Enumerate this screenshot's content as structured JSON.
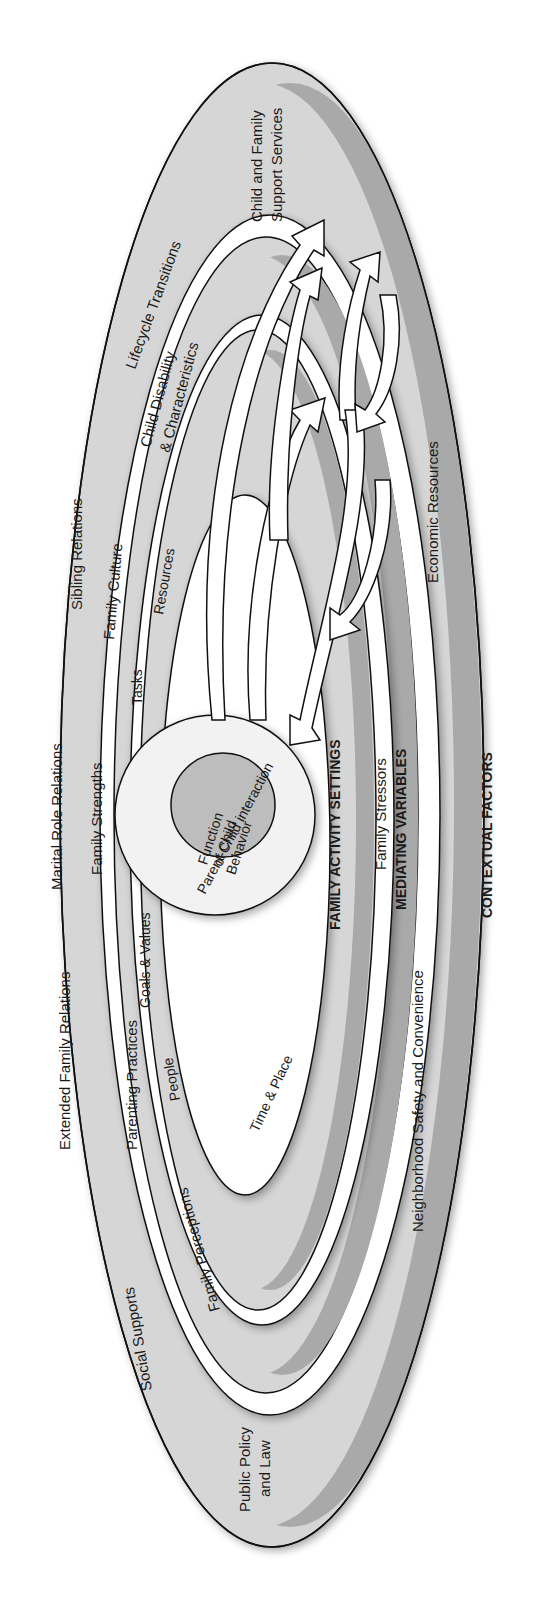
{
  "figure": {
    "layers": {
      "contextual_factors": {
        "title": "CONTEXTUAL FACTORS",
        "items": [
          "Child and Family Support Services",
          "Lifecycle Transitions",
          "Sibling Relations",
          "Marital Role Relations",
          "Extended Family Relations",
          "Social Supports",
          "Public Policy and Law",
          "Neighborhood Safety and Convenience",
          "Economic Resources"
        ],
        "child_family_l1": "Child and Family",
        "child_family_l2": "Support Services",
        "lifecycle": "Lifecycle Transitions",
        "sibling": "Sibling Relations",
        "marital": "Marital Role Relations",
        "extended": "Extended Family Relations",
        "social": "Social Supports",
        "policy_l1": "Public Policy",
        "policy_l2": "and Law",
        "neighborhood": "Neighborhood Safety and Convenience",
        "economic": "Economic Resources"
      },
      "mediating_variables": {
        "title": "MEDIATING VARIABLES",
        "disability_l1": "Child Disability",
        "disability_l2": "& Characteristics",
        "culture": "Family Culture",
        "strengths": "Family Strengths",
        "parenting": "Parenting Practices",
        "perceptions": "Family Perceptions",
        "stressors": "Family Stressors"
      },
      "family_activity_settings": {
        "title": "FAMILY ACTIVITY SETTINGS",
        "resources": "Resources",
        "tasks": "Tasks",
        "goals": "Goals & Values",
        "people": "People",
        "time_place": "Time & Place"
      },
      "core": {
        "interaction": "Parent-Child interaction",
        "function_l1": "Function",
        "function_l2": "of Child",
        "function_l3": "Behavior"
      }
    },
    "colors": {
      "outer_fill": "#d6d6d6",
      "band_dark": "#a8a8a8",
      "white_band": "#ffffff",
      "inner_fill": "#dcdcdc",
      "core_fill": "#bdbdbd",
      "stroke": "#111111"
    }
  }
}
